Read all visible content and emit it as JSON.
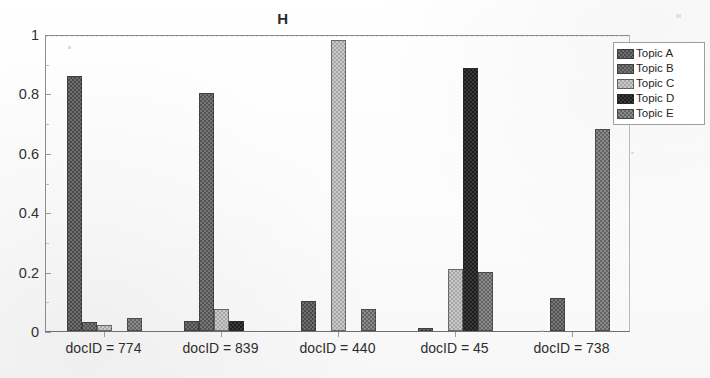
{
  "chart_data": {
    "type": "bar",
    "title": "H",
    "xlabel": "",
    "ylabel": "",
    "ylim": [
      0,
      1
    ],
    "grid": false,
    "legend_position": "top-right",
    "orientation": "vertical",
    "grouping": "clustered",
    "categories": [
      "docID = 774",
      "docID = 839",
      "docID = 440",
      "docID = 45",
      "docID = 738"
    ],
    "ytick_labels": [
      "0",
      "0.2",
      "0.4",
      "0.6",
      "0.8",
      "1"
    ],
    "ytick_values": [
      0,
      0.2,
      0.4,
      0.6,
      0.8,
      1
    ],
    "series": [
      {
        "name": "Topic A",
        "color": "#6e6e6e",
        "values": [
          0.86,
          0.035,
          0.1,
          0.01,
          0.0
        ]
      },
      {
        "name": "Topic B",
        "color": "#767676",
        "values": [
          0.03,
          0.8,
          0.0,
          0.0,
          0.11
        ]
      },
      {
        "name": "Topic C",
        "color": "#c9c9c9",
        "values": [
          0.02,
          0.075,
          0.98,
          0.21,
          0.0
        ]
      },
      {
        "name": "Topic D",
        "color": "#3a3a3a",
        "values": [
          0.0,
          0.035,
          0.0,
          0.885,
          0.0
        ]
      },
      {
        "name": "Topic E",
        "color": "#8a8a8a",
        "values": [
          0.045,
          0.0,
          0.075,
          0.2,
          0.68
        ]
      }
    ]
  },
  "legend": {
    "entries": [
      {
        "label": "Topic A"
      },
      {
        "label": "Topic B"
      },
      {
        "label": "Topic C"
      },
      {
        "label": "Topic D"
      },
      {
        "label": "Topic E"
      }
    ]
  }
}
